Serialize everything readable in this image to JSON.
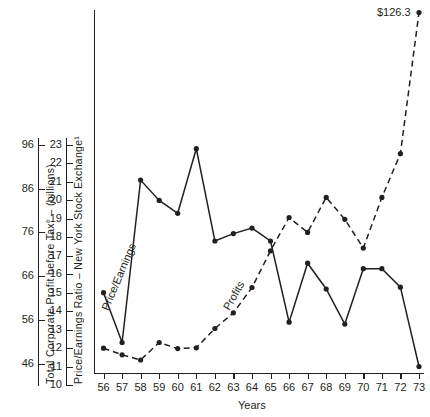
{
  "chart_data": {
    "type": "line",
    "title": "",
    "xlabel": "Years",
    "x": [
      56,
      57,
      58,
      59,
      60,
      61,
      62,
      63,
      64,
      65,
      66,
      67,
      68,
      69,
      70,
      71,
      72,
      73
    ],
    "xticklabels": [
      "56",
      "57",
      "58",
      "59",
      "60",
      "61",
      "62",
      "63",
      "64",
      "65",
      "66",
      "67",
      "68",
      "69",
      "70",
      "71",
      "72",
      "73"
    ],
    "grid": false,
    "legend": "inline-curve-labels",
    "annotations": [
      {
        "text": "$126.3",
        "series": "Profits",
        "x": 73,
        "note": "value at right end of dashed profits curve"
      }
    ],
    "axes": [
      {
        "id": "left",
        "position": "left",
        "label": "Total Corporate Profit before Tax° – (billions)",
        "ticklabels": [
          "96",
          "86",
          "76",
          "66",
          "56",
          "46"
        ],
        "ticks": [
          96,
          86,
          76,
          66,
          56,
          46
        ],
        "ylim": [
          46,
          101
        ]
      },
      {
        "id": "right-inner",
        "position": "left-inner",
        "label": "Price/Earnings Ratio – New York Stock Exchange¹",
        "ticklabels": [
          "23",
          "22",
          "21",
          "20",
          "19",
          "18",
          "17",
          "16",
          "15",
          "14",
          "13",
          "12",
          "11",
          "10"
        ],
        "ticks": [
          23,
          22,
          21,
          20,
          19,
          18,
          17,
          16,
          15,
          14,
          13,
          12,
          11,
          10
        ],
        "ylim": [
          10,
          23
        ]
      }
    ],
    "series": [
      {
        "name": "Price/Earnings",
        "axis": "right-inner",
        "style": "solid",
        "marker": "filled-circle",
        "label_text": "Price/Earnings",
        "values": [
          15.0,
          12.3,
          21.1,
          20.0,
          19.3,
          22.8,
          17.8,
          18.2,
          18.5,
          17.8,
          13.4,
          16.6,
          15.2,
          13.3,
          16.3,
          16.3,
          15.3,
          11.0
        ]
      },
      {
        "name": "Profits",
        "axis": "left",
        "style": "dashed",
        "marker": "filled-circle",
        "label_text": "Profits",
        "values": [
          49.5,
          48.0,
          46.8,
          50.8,
          49.4,
          49.6,
          54.0,
          57.6,
          63.4,
          71.8,
          79.4,
          76.0,
          84.0,
          79.0,
          72.4,
          84.0,
          94.0,
          126.3
        ]
      }
    ]
  },
  "labels": {
    "price_earnings_curve": "Price/Earnings",
    "profits_curve": "Profits",
    "peak_value": "$126.3",
    "x_axis_name": "Years",
    "left_axis_title": "Total Corporate Profit before Tax° – (billions)",
    "inner_axis_title": "Price/Earnings Ratio – New York Stock Exchange¹"
  }
}
